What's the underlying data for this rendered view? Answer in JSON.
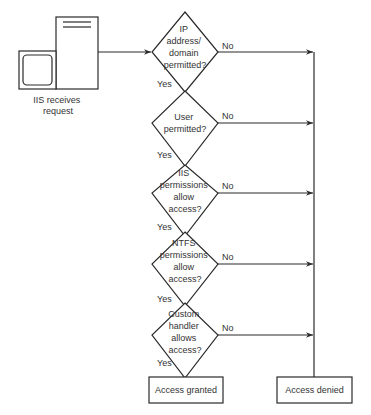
{
  "diagram": {
    "start": {
      "label_lines": [
        "IIS receives",
        "request"
      ],
      "icon": "server-computer-icon"
    },
    "decisions": [
      {
        "lines": [
          "IP",
          "address/",
          "domain",
          "permitted?"
        ],
        "cy": 52,
        "yes_label": "Yes",
        "no_label": "No"
      },
      {
        "lines": [
          "User",
          "permitted?"
        ],
        "cy": 123,
        "yes_label": "Yes",
        "no_label": "No"
      },
      {
        "lines": [
          "IIS",
          "permissions",
          "allow",
          "access?"
        ],
        "cy": 193,
        "yes_label": "Yes",
        "no_label": "No"
      },
      {
        "lines": [
          "NTFS",
          "permissions",
          "allow",
          "access?"
        ],
        "cy": 264,
        "yes_label": "Yes",
        "no_label": "No"
      },
      {
        "lines": [
          "Custom",
          "handler",
          "allows",
          "access?"
        ],
        "cy": 335,
        "yes_label": "Yes",
        "no_label": "No"
      }
    ],
    "outcomes": {
      "granted": "Access granted",
      "denied": "Access denied"
    },
    "colors": {
      "line": "#2a2a2a",
      "text": "#333333",
      "background": "#ffffff"
    }
  }
}
